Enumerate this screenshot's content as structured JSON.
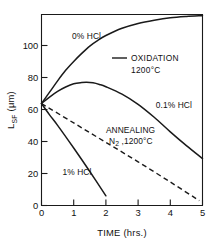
{
  "chart_data": {
    "type": "line",
    "title": "",
    "subtitle": "",
    "xlabel": "TIME (hrs.)",
    "ylabel": "L",
    "ylabel_sub": "SF",
    "ylabel_unit": " (μm)",
    "xlim": [
      0,
      5
    ],
    "ylim": [
      0,
      118
    ],
    "xticks": [
      0,
      1,
      2,
      3,
      4,
      5
    ],
    "xtick_labels": [
      "0",
      "1",
      "2",
      "3",
      "4",
      "5"
    ],
    "yticks": [
      0,
      20,
      40,
      60,
      80,
      100
    ],
    "ytick_labels": [
      "0",
      "20",
      "40",
      "60",
      "80",
      "100"
    ],
    "grid": false,
    "legend_position": "inside-upper-right",
    "annotations": [
      {
        "text": "0% HCl",
        "x": 0.95,
        "y": 103
      },
      {
        "text": "0.1% HCl",
        "x": 3.55,
        "y": 60
      },
      {
        "text": "1% HCl",
        "x": 0.65,
        "y": 19
      },
      {
        "text": "ANNEALING",
        "x": 2.0,
        "y": 45
      },
      {
        "text": "N₂ ,1200°C",
        "x": 2.1,
        "y": 38
      }
    ],
    "legend": [
      {
        "label_line1": "OXIDATION",
        "label_line2": "1200°C",
        "style": "solid"
      }
    ],
    "series": [
      {
        "name": "0% HCl",
        "style": "solid",
        "x": [
          0,
          0.25,
          0.5,
          0.75,
          1.0,
          1.25,
          1.5,
          1.75,
          2.0,
          2.5,
          3.0,
          3.5,
          4.0,
          4.5,
          5.0
        ],
        "y": [
          63,
          70,
          77,
          83.5,
          89,
          94,
          98.5,
          102,
          105,
          109.5,
          112.5,
          114.5,
          116,
          116.8,
          117.3
        ]
      },
      {
        "name": "0.1% HCl",
        "style": "solid",
        "x": [
          0,
          0.25,
          0.5,
          0.75,
          1.0,
          1.25,
          1.4,
          1.6,
          1.8,
          2.0,
          2.5,
          3.0,
          3.5,
          4.0,
          4.5,
          5.0
        ],
        "y": [
          63,
          67,
          70.5,
          73.2,
          75.2,
          76.0,
          76.2,
          75.8,
          74.8,
          73.4,
          68.8,
          62.5,
          54.5,
          45.5,
          37.0,
          29.0
        ]
      },
      {
        "name": "1% HCl",
        "style": "solid",
        "x": [
          0,
          0.25,
          0.5,
          1.0,
          1.5,
          2.0
        ],
        "y": [
          63,
          56,
          49.5,
          35.5,
          21.0,
          6.0
        ]
      },
      {
        "name": "ANNEALING N2 ,1200°C",
        "style": "dashed",
        "x": [
          0,
          1.0,
          2.0,
          3.0,
          4.0,
          4.9
        ],
        "y": [
          63,
          51,
          39,
          27,
          14.5,
          3.0
        ]
      }
    ]
  }
}
